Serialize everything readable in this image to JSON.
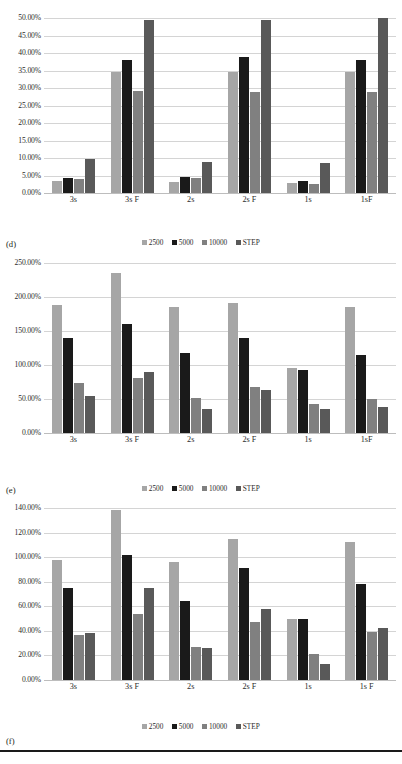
{
  "document": {
    "background_color": "#ffffff",
    "text_color": "#231f20",
    "bottom_rule_color": "#1a1a1a"
  },
  "series_colors": {
    "2500": "#a6a6a6",
    "5000": "#1a1a1a",
    "10000": "#808080",
    "STEP": "#595959"
  },
  "captions": {
    "d": "(d)",
    "e": "(e)",
    "f": "(f)"
  },
  "legend": {
    "items": [
      {
        "label": "2500",
        "color": "#a6a6a6"
      },
      {
        "label": "5000",
        "color": "#1a1a1a"
      },
      {
        "label": "10000",
        "color": "#808080"
      },
      {
        "label": "STEP",
        "color": "#595959"
      }
    ]
  },
  "chart_data": [
    {
      "id": "d",
      "type": "bar",
      "title": "",
      "xlabel": "",
      "ylabel": "",
      "ylim": [
        0,
        50
      ],
      "ytick_labels": [
        "0.00%",
        "5.00%",
        "10.00%",
        "15.00%",
        "20.00%",
        "25.00%",
        "30.00%",
        "35.00%",
        "40.00%",
        "45.00%",
        "50.00%"
      ],
      "ytick_values": [
        0,
        5,
        10,
        15,
        20,
        25,
        30,
        35,
        40,
        45,
        50
      ],
      "grid": true,
      "legend_position": "bottom",
      "categories": [
        "3s",
        "3s F",
        "2s",
        "2s F",
        "1s",
        "1sF"
      ],
      "series": [
        {
          "name": "2500",
          "color": "#a6a6a6",
          "values": [
            3.5,
            34.5,
            3.2,
            34.6,
            3.0,
            34.5
          ]
        },
        {
          "name": "5000",
          "color": "#1a1a1a",
          "values": [
            4.4,
            38.0,
            4.7,
            39.0,
            3.5,
            38.0
          ]
        },
        {
          "name": "10000",
          "color": "#808080",
          "values": [
            4.1,
            29.2,
            4.3,
            29.0,
            2.6,
            28.8
          ]
        },
        {
          "name": "STEP",
          "color": "#595959",
          "values": [
            9.6,
            49.3,
            8.8,
            49.3,
            8.5,
            50.0
          ]
        }
      ]
    },
    {
      "id": "e",
      "type": "bar",
      "title": "",
      "xlabel": "",
      "ylabel": "",
      "ylim": [
        0,
        250
      ],
      "ytick_labels": [
        "0.00%",
        "50.00%",
        "100.00%",
        "150.00%",
        "200.00%",
        "250.00%"
      ],
      "ytick_values": [
        0,
        50,
        100,
        150,
        200,
        250
      ],
      "grid": true,
      "legend_position": "bottom",
      "categories": [
        "3s",
        "3s F",
        "2s",
        "2s F",
        "1s",
        "1sF"
      ],
      "series": [
        {
          "name": "2500",
          "color": "#a6a6a6",
          "values": [
            188,
            236,
            185,
            191,
            95,
            185
          ]
        },
        {
          "name": "5000",
          "color": "#1a1a1a",
          "values": [
            140,
            161,
            118,
            139,
            93,
            115
          ]
        },
        {
          "name": "10000",
          "color": "#808080",
          "values": [
            73,
            81,
            52,
            67,
            42,
            50
          ]
        },
        {
          "name": "STEP",
          "color": "#595959",
          "values": [
            55,
            90,
            36,
            63,
            36,
            38
          ]
        }
      ]
    },
    {
      "id": "f",
      "type": "bar",
      "title": "",
      "xlabel": "",
      "ylabel": "",
      "ylim": [
        0,
        140
      ],
      "ytick_labels": [
        "0.00%",
        "20.00%",
        "40.00%",
        "60.00%",
        "80.00%",
        "100.00%",
        "120.00%",
        "140.00%"
      ],
      "ytick_values": [
        0,
        20,
        40,
        60,
        80,
        100,
        120,
        140
      ],
      "grid": true,
      "legend_position": "bottom",
      "categories": [
        "3s",
        "3s F",
        "2s",
        "2s F",
        "1s",
        "1s F"
      ],
      "series": [
        {
          "name": "2500",
          "color": "#a6a6a6",
          "values": [
            98,
            138,
            96,
            115,
            50,
            112
          ]
        },
        {
          "name": "5000",
          "color": "#1a1a1a",
          "values": [
            75,
            102,
            64,
            91,
            50,
            78.5
          ]
        },
        {
          "name": "10000",
          "color": "#808080",
          "values": [
            37,
            54,
            27,
            47.5,
            21.5,
            39
          ]
        },
        {
          "name": "STEP",
          "color": "#595959",
          "values": [
            38.5,
            75,
            26,
            58,
            13,
            42
          ]
        }
      ]
    }
  ]
}
